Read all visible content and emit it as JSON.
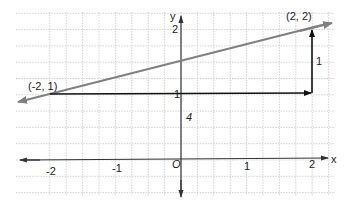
{
  "diagram": {
    "type": "coordinate-plane-slope-triangle",
    "axes": {
      "x_label": "x",
      "y_label": "y",
      "origin_label": "O",
      "x_ticks": [
        "-2",
        "-1",
        "1",
        "2"
      ],
      "y_ticks": [
        "1",
        "2"
      ]
    },
    "points": [
      {
        "label": "(-2, 1)",
        "x": -2,
        "y": 1
      },
      {
        "label": "(2, 2)",
        "x": 2,
        "y": 2
      }
    ],
    "line": {
      "through": [
        [
          -2,
          1
        ],
        [
          2,
          2
        ]
      ],
      "color": "#808080"
    },
    "run": {
      "label": "4",
      "from": [
        -2,
        1
      ],
      "to": [
        2,
        1
      ]
    },
    "rise": {
      "label": "1",
      "from": [
        2,
        1
      ],
      "to": [
        2,
        2
      ]
    },
    "colors": {
      "grid": "#c8c8c8",
      "axis": "#333333",
      "line": "#808080",
      "vector": "#111111"
    }
  }
}
